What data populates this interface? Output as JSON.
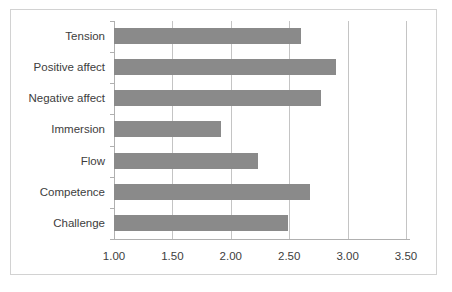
{
  "chart_data": {
    "type": "bar",
    "orientation": "horizontal",
    "title": "",
    "subtitle": "",
    "xlabel": "",
    "ylabel": "",
    "categories": [
      "Challenge",
      "Competence",
      "Flow",
      "Immersion",
      "Negative affect",
      "Positive affect",
      "Tension"
    ],
    "values": [
      2.49,
      2.68,
      2.23,
      1.92,
      2.77,
      2.9,
      2.6
    ],
    "series": [
      {
        "name": "Mean score",
        "values": [
          2.49,
          2.68,
          2.23,
          1.92,
          2.77,
          2.9,
          2.6
        ]
      }
    ],
    "display_order_top_to_bottom": [
      "Tension",
      "Positive affect",
      "Negative affect",
      "Immersion",
      "Flow",
      "Competence",
      "Challenge"
    ],
    "xlim": [
      1.0,
      3.5
    ],
    "xticks": [
      1.0,
      1.5,
      2.0,
      2.5,
      3.0,
      3.5
    ],
    "xtick_labels": [
      "1.00",
      "1.50",
      "2.00",
      "2.50",
      "3.00",
      "3.50"
    ],
    "grid": true,
    "grid_axis": "x",
    "legend": false,
    "legend_position": "none",
    "bar_color": "#8a8a8a",
    "gridline_color": "#c4c4c4",
    "axis_color": "#b0b0b0",
    "background_color": "#ffffff",
    "border_color": "#d2d2d2",
    "annotations": []
  },
  "bars": [
    {
      "label": "Tension",
      "value": 2.6
    },
    {
      "label": "Positive affect",
      "value": 2.9
    },
    {
      "label": "Negative affect",
      "value": 2.77
    },
    {
      "label": "Immersion",
      "value": 1.92
    },
    {
      "label": "Flow",
      "value": 2.23
    },
    {
      "label": "Competence",
      "value": 2.68
    },
    {
      "label": "Challenge",
      "value": 2.49
    }
  ],
  "xticks": [
    {
      "label": "1.00",
      "value": 1.0
    },
    {
      "label": "1.50",
      "value": 1.5
    },
    {
      "label": "2.00",
      "value": 2.0
    },
    {
      "label": "2.50",
      "value": 2.5
    },
    {
      "label": "3.00",
      "value": 3.0
    },
    {
      "label": "3.50",
      "value": 3.5
    }
  ]
}
